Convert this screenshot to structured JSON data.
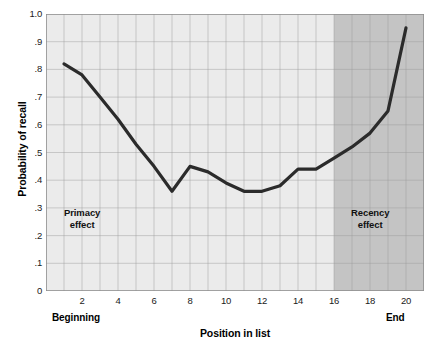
{
  "chart_data": {
    "type": "line",
    "title": "",
    "xlabel": "Position in list",
    "ylabel": "Probability of recall",
    "x": [
      1,
      2,
      3,
      4,
      5,
      6,
      7,
      8,
      9,
      10,
      11,
      12,
      13,
      14,
      15,
      16,
      17,
      18,
      19,
      20
    ],
    "values": [
      0.82,
      0.78,
      0.7,
      0.62,
      0.53,
      0.45,
      0.36,
      0.45,
      0.43,
      0.39,
      0.36,
      0.36,
      0.38,
      0.44,
      0.44,
      0.48,
      0.52,
      0.57,
      0.65,
      0.95
    ],
    "series": [
      {
        "name": "Probability of recall",
        "values": [
          0.82,
          0.78,
          0.7,
          0.62,
          0.53,
          0.45,
          0.36,
          0.45,
          0.43,
          0.39,
          0.36,
          0.36,
          0.38,
          0.44,
          0.44,
          0.48,
          0.52,
          0.57,
          0.65,
          0.95
        ]
      }
    ],
    "xlim": [
      0,
      21
    ],
    "ylim": [
      0,
      1.0
    ],
    "x_tick_values": [
      2,
      4,
      6,
      8,
      10,
      12,
      14,
      16,
      18,
      20
    ],
    "x_tick_labels": [
      "2",
      "4",
      "6",
      "8",
      "10",
      "12",
      "14",
      "16",
      "18",
      "20"
    ],
    "y_tick_values": [
      0,
      0.1,
      0.2,
      0.3,
      0.4,
      0.5,
      0.6,
      0.7,
      0.8,
      0.9,
      1.0
    ],
    "y_tick_labels": [
      "0",
      ".1",
      ".2",
      ".3",
      ".4",
      ".5",
      ".6",
      ".7",
      ".8",
      ".9",
      "1.0"
    ],
    "grid": true,
    "legend": "none",
    "annotations": [
      {
        "name": "primacy",
        "text_line1": "Primacy",
        "text_line2": "effect"
      },
      {
        "name": "recency",
        "text_line1": "Recency",
        "text_line2": "effect"
      }
    ],
    "axis_end_labels": {
      "left": "Beginning",
      "right": "End"
    },
    "shaded_region": {
      "name": "recency-region",
      "x_start": 16,
      "x_end": 21,
      "color": "#c4c4c4"
    },
    "colors": {
      "line": "#2b2b2b",
      "plot_background": "#ebebeb",
      "grid": "#9a9a9a",
      "shaded_band": "#c4c4c4",
      "text": "#111111",
      "figure_background": "#ffffff"
    }
  }
}
